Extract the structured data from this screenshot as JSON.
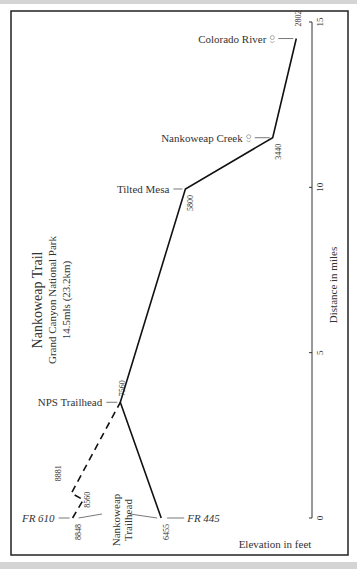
{
  "chart_data": {
    "type": "line",
    "title": "Nankoweap Trail",
    "subtitle": "Grand Canyon National Park",
    "length_note": "14.5mls (23.2km)",
    "ylabel": "Distance in miles",
    "xlabel": "Elevation in feet",
    "distance_range": [
      0,
      15
    ],
    "distance_ticks": [
      "0",
      "5",
      "10",
      "15"
    ],
    "trailhead_label": "Nankoweap Trailhead",
    "series": [
      {
        "name": "Main trail (from FR 445)",
        "style": "solid",
        "points": [
          {
            "distance": 0,
            "elevation": 6455,
            "elevation_label": "6455",
            "name": "FR 445"
          },
          {
            "distance": 3.5,
            "elevation": 7560,
            "elevation_label": "7560",
            "name": "NPS Trailhead"
          },
          {
            "distance": 9.95,
            "elevation": 5800,
            "elevation_label": "5800",
            "name": "Tilted Mesa"
          },
          {
            "distance": 11.5,
            "elevation": 3440,
            "elevation_label": "3440",
            "name": "Nankoweap Creek"
          },
          {
            "distance": 14.5,
            "elevation": 2802,
            "elevation_label": "2802",
            "name": "Colorado River"
          }
        ]
      },
      {
        "name": "Alternate trail (from FR 610)",
        "style": "dashed",
        "points": [
          {
            "distance": 0,
            "elevation": 8848,
            "elevation_label": "8848",
            "name": "FR 610"
          },
          {
            "distance": 0.55,
            "elevation": 8560,
            "elevation_label": "8560",
            "name": ""
          },
          {
            "distance": 0.75,
            "elevation": 8881,
            "elevation_label": "8881",
            "name": ""
          },
          {
            "distance": 3.5,
            "elevation": 7560,
            "elevation_label": "",
            "name": ""
          }
        ]
      }
    ],
    "water_icons": [
      "Nankoweap Creek",
      "Colorado River"
    ],
    "labels": {
      "colorado": "Colorado River",
      "creek": "Nankoweap Creek",
      "mesa": "Tilted Mesa",
      "nps": "NPS Trailhead",
      "fr610": "FR 610",
      "fr445": "FR 445",
      "th1": "Nankoweap",
      "th2": "Trailhead"
    }
  }
}
